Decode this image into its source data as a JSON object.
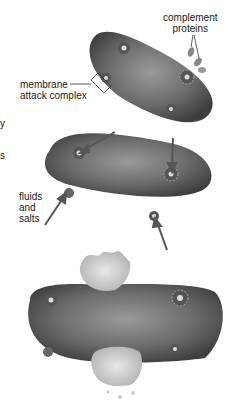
{
  "diagram": {
    "labels": {
      "complement_proteins": "complement proteins",
      "complement_line1": "complement",
      "complement_line2": "proteins",
      "mac_line1": "membrane",
      "mac_line2": "attack complex",
      "fluids_line1": "fluids",
      "fluids_line2": "and",
      "fluids_line3": "salts"
    },
    "edge_fragments": [
      "y",
      "s"
    ],
    "stages": [
      {
        "name": "complement proteins attach, forming membrane attack complexes"
      },
      {
        "name": "fluids and salts enter through pores"
      },
      {
        "name": "bacterium bursts"
      }
    ]
  }
}
